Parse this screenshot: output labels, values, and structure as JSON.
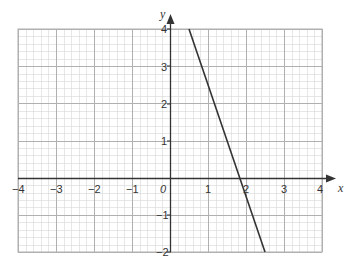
{
  "chart_data": {
    "type": "line",
    "title": "",
    "xlabel": "x",
    "ylabel": "y",
    "xlim": [
      -4,
      4
    ],
    "ylim": [
      -2,
      4
    ],
    "grid": true,
    "grid_minor_step": 0.2,
    "x_ticks": [
      "-4",
      "-3",
      "-2",
      "-1",
      "1",
      "2",
      "3",
      "4"
    ],
    "y_ticks": [
      "-2",
      "-1",
      "1",
      "2",
      "3",
      "4"
    ],
    "origin_label": "0",
    "series": [
      {
        "name": "y = -2x + 3",
        "x": [
          0.5,
          2.5
        ],
        "y": [
          4,
          -2
        ],
        "color": "#333333"
      }
    ]
  },
  "labels": {
    "x_axis": "x",
    "y_axis": "y",
    "origin": "0",
    "xt_m4": "−4",
    "xt_m3": "−3",
    "xt_m2": "−2",
    "xt_m1": "−1",
    "xt_1": "1",
    "xt_2": "2",
    "xt_3": "3",
    "xt_4": "4",
    "yt_4": "4",
    "yt_3": "3",
    "yt_2": "2",
    "yt_1": "1",
    "yt_m1": "−1",
    "yt_m2": "−2"
  },
  "colors": {
    "minor_grid": "#d6d6d6",
    "major_grid": "#b0b0b0",
    "axis": "#333333",
    "line": "#333333"
  }
}
